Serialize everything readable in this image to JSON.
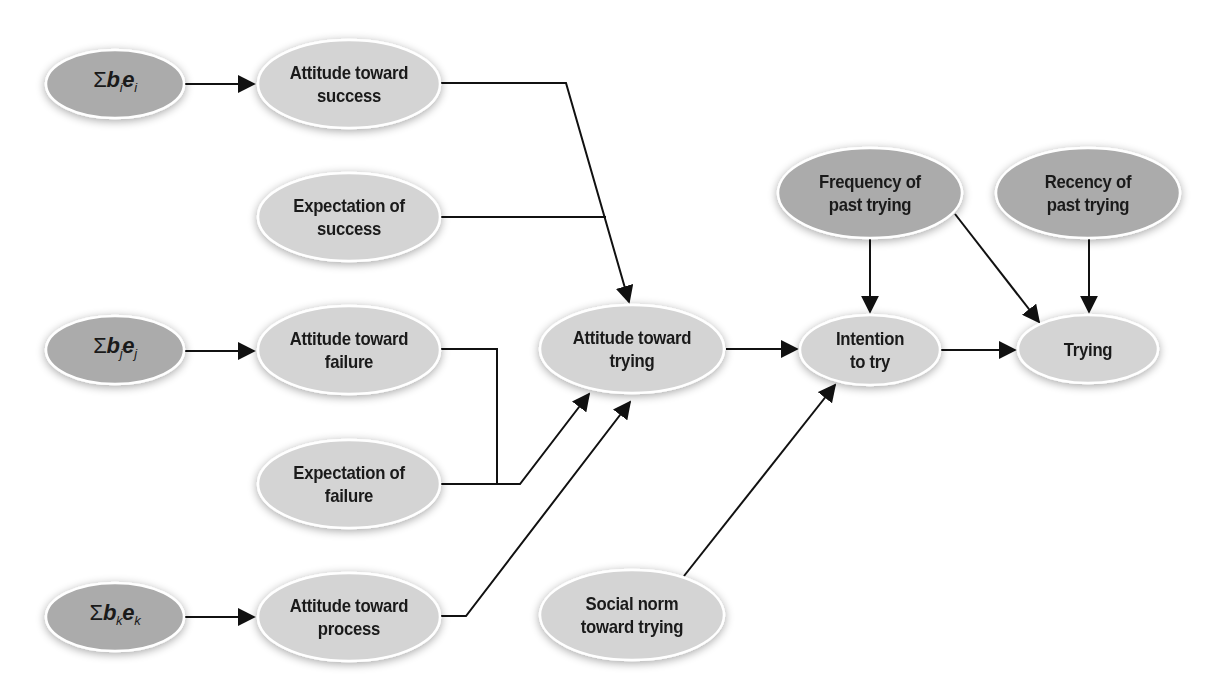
{
  "diagram": {
    "title": "",
    "colors": {
      "light_node": "#d4d4d4",
      "dark_node": "#ababab",
      "edge": "#111111",
      "node_border": "#ffffff",
      "text": "#1a1a1a"
    },
    "nodes": {
      "sum_i": {
        "sigma": "Σ",
        "b": "b",
        "b_sub": "i",
        "e": "e",
        "e_sub": "i",
        "shade": "dark"
      },
      "sum_j": {
        "sigma": "Σ",
        "b": "b",
        "b_sub": "j",
        "e": "e",
        "e_sub": "j",
        "shade": "dark"
      },
      "sum_k": {
        "sigma": "Σ",
        "b": "b",
        "b_sub": "k",
        "e": "e",
        "e_sub": "k",
        "shade": "dark"
      },
      "att_success": {
        "line1": "Attitude toward",
        "line2": "success",
        "shade": "light"
      },
      "exp_success": {
        "line1": "Expectation of",
        "line2": "success",
        "shade": "light"
      },
      "att_failure": {
        "line1": "Attitude toward",
        "line2": "failure",
        "shade": "light"
      },
      "exp_failure": {
        "line1": "Expectation of",
        "line2": "failure",
        "shade": "light"
      },
      "att_process": {
        "line1": "Attitude toward",
        "line2": "process",
        "shade": "light"
      },
      "att_trying": {
        "line1": "Attitude toward",
        "line2": "trying",
        "shade": "light"
      },
      "social_norm": {
        "line1": "Social norm",
        "line2": "toward trying",
        "shade": "light"
      },
      "intention": {
        "line1": "Intention",
        "line2": "to try",
        "shade": "light"
      },
      "frequency": {
        "line1": "Frequency of",
        "line2": "past trying",
        "shade": "dark"
      },
      "recency": {
        "line1": "Recency of",
        "line2": "past trying",
        "shade": "dark"
      },
      "trying": {
        "line1": "Trying",
        "shade": "light"
      }
    },
    "edges": [
      {
        "from": "Σbiei",
        "to": "Attitude toward success"
      },
      {
        "from": "Σbjej",
        "to": "Attitude toward failure"
      },
      {
        "from": "Σbkek",
        "to": "Attitude toward process"
      },
      {
        "from": "Attitude toward success",
        "to": "Attitude toward trying"
      },
      {
        "from": "Expectation of success",
        "to": "Attitude toward trying"
      },
      {
        "from": "Attitude toward failure",
        "to": "Attitude toward trying"
      },
      {
        "from": "Expectation of failure",
        "to": "Attitude toward trying"
      },
      {
        "from": "Attitude toward process",
        "to": "Attitude toward trying"
      },
      {
        "from": "Attitude toward trying",
        "to": "Intention to try"
      },
      {
        "from": "Social norm toward trying",
        "to": "Intention to try"
      },
      {
        "from": "Frequency of past trying",
        "to": "Intention to try"
      },
      {
        "from": "Frequency of past trying",
        "to": "Trying"
      },
      {
        "from": "Recency of past trying",
        "to": "Trying"
      },
      {
        "from": "Intention to try",
        "to": "Trying"
      }
    ]
  }
}
